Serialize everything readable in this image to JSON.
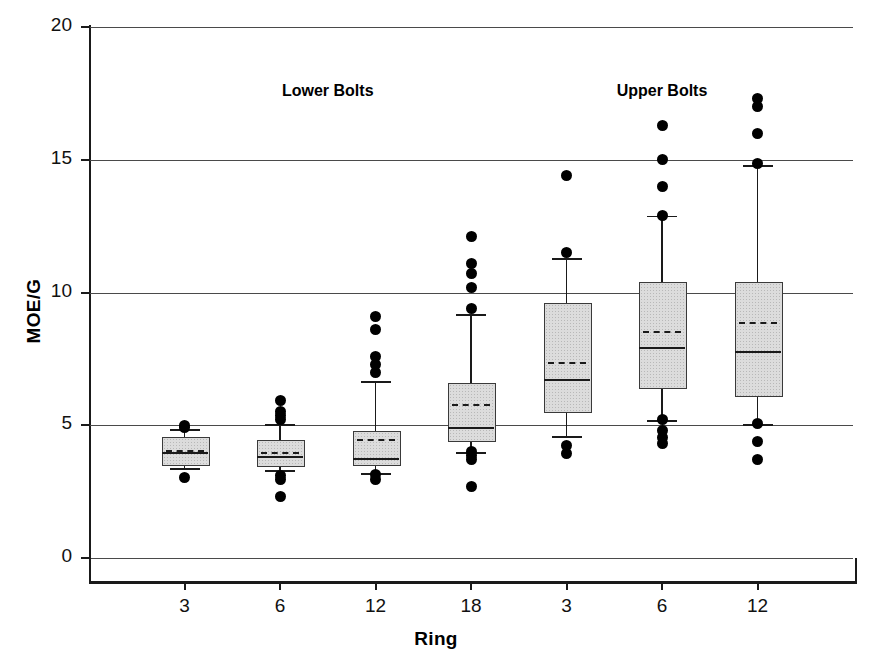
{
  "chart_data": {
    "type": "box",
    "title": "",
    "xlabel": "Ring",
    "ylabel": "MOE/G",
    "ylim": [
      0,
      20
    ],
    "yticks": [
      0,
      5,
      10,
      15,
      20
    ],
    "ytick_labels": [
      "0",
      "5",
      "10",
      "15",
      "20"
    ],
    "grid": true,
    "grid_axis": "y",
    "categories": [
      "3",
      "6",
      "12",
      "18",
      "3",
      "6",
      "12"
    ],
    "group_labels": [
      "Lower Bolts",
      "Upper Bolts"
    ],
    "groups": [
      {
        "label": "Lower Bolts",
        "categories": [
          "3",
          "6",
          "12",
          "18"
        ]
      },
      {
        "label": "Upper Bolts",
        "categories": [
          "3",
          "6",
          "12"
        ]
      }
    ],
    "boxes": [
      {
        "group": "Lower Bolts",
        "ring": "3",
        "whisker_low": 3.4,
        "q1": 3.55,
        "median": 4.0,
        "mean": 4.05,
        "q3": 4.55,
        "whisker_high": 4.85,
        "outliers": [
          5.0,
          4.9,
          3.05
        ]
      },
      {
        "group": "Lower Bolts",
        "ring": "6",
        "whisker_low": 3.3,
        "q1": 3.5,
        "median": 3.85,
        "mean": 4.0,
        "q3": 4.45,
        "whisker_high": 5.05,
        "outliers": [
          5.95,
          5.5,
          5.35,
          5.2,
          3.1,
          2.95,
          2.3
        ]
      },
      {
        "group": "Lower Bolts",
        "ring": "12",
        "whisker_low": 3.2,
        "q1": 3.55,
        "median": 3.75,
        "mean": 4.5,
        "q3": 4.8,
        "whisker_high": 6.65,
        "outliers": [
          9.1,
          8.6,
          7.6,
          7.3,
          7.0,
          3.15,
          2.95
        ]
      },
      {
        "group": "Lower Bolts",
        "ring": "18",
        "whisker_low": 4.0,
        "q1": 4.45,
        "median": 4.95,
        "mean": 5.8,
        "q3": 6.6,
        "whisker_high": 9.2,
        "outliers": [
          12.1,
          11.1,
          10.7,
          10.2,
          9.4,
          4.0,
          3.85,
          3.7,
          2.7
        ]
      },
      {
        "group": "Upper Bolts",
        "ring": "3",
        "whisker_low": 4.6,
        "q1": 5.55,
        "median": 6.75,
        "mean": 7.4,
        "q3": 9.6,
        "whisker_high": 11.3,
        "outliers": [
          14.4,
          11.5,
          4.25,
          3.95
        ]
      },
      {
        "group": "Upper Bolts",
        "ring": "6",
        "whisker_low": 5.2,
        "q1": 6.45,
        "median": 7.95,
        "mean": 8.55,
        "q3": 10.4,
        "whisker_high": 12.9,
        "outliers": [
          16.3,
          15.0,
          14.0,
          12.9,
          5.2,
          4.8,
          4.55,
          4.3
        ]
      },
      {
        "group": "Upper Bolts",
        "ring": "12",
        "whisker_low": 5.05,
        "q1": 6.15,
        "median": 7.8,
        "mean": 8.9,
        "q3": 10.4,
        "whisker_high": 14.8,
        "outliers": [
          17.3,
          17.0,
          16.0,
          14.85,
          5.05,
          4.4,
          3.7
        ]
      }
    ]
  },
  "axes": {
    "y_title": "MOE/G",
    "x_title": "Ring"
  }
}
